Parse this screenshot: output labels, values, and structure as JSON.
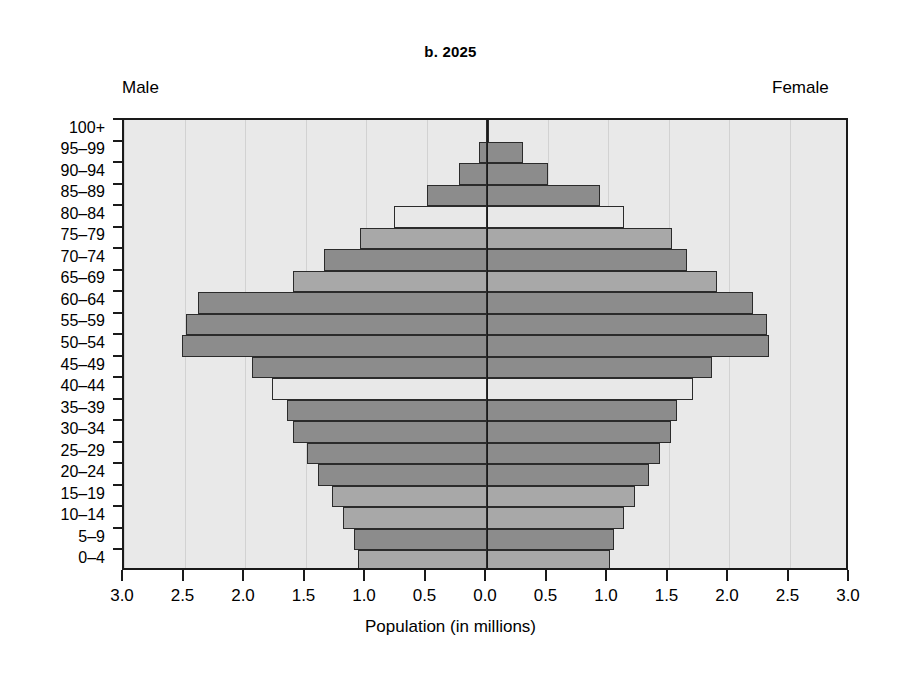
{
  "title": "b. 2025",
  "labels": {
    "male": "Male",
    "female": "Female",
    "axis_title": "Population (in millions)"
  },
  "colors": {
    "plot_background": "#e9e9e9",
    "axis": "#1a1a1a",
    "bar_dark": "#8c8c8c",
    "bar_mid": "#a8a8a8",
    "bar_light": "#e8e8e8",
    "gridline": "#d2d2d2",
    "page_background": "#ffffff"
  },
  "chart_data": {
    "type": "bar",
    "subtype": "population-pyramid",
    "title": "b. 2025",
    "xlabel": "Population (in millions)",
    "ylabel": "",
    "grid": true,
    "legend_position": "none",
    "xlim": [
      -3.0,
      3.0
    ],
    "xticks": [
      3.0,
      2.5,
      2.0,
      1.5,
      1.0,
      0.5,
      0.0,
      0.5,
      1.0,
      1.5,
      2.0,
      2.5,
      3.0
    ],
    "xtick_labels": [
      "3.0",
      "2.5",
      "2.0",
      "1.5",
      "1.0",
      "0.5",
      "0.0",
      "0.5",
      "1.0",
      "1.5",
      "2.0",
      "2.5",
      "3.0"
    ],
    "categories": [
      "0–4",
      "5–9",
      "10–14",
      "15–19",
      "20–24",
      "25–29",
      "30–34",
      "35–39",
      "40–44",
      "45–49",
      "50–54",
      "55–59",
      "60–64",
      "65–69",
      "70–74",
      "75–79",
      "80–84",
      "85–89",
      "90–94",
      "95–99",
      "100+"
    ],
    "series": [
      {
        "name": "Male",
        "side": "left",
        "values": [
          1.07,
          1.1,
          1.19,
          1.28,
          1.4,
          1.49,
          1.6,
          1.65,
          1.78,
          1.94,
          2.52,
          2.49,
          2.39,
          1.6,
          1.35,
          1.05,
          0.77,
          0.5,
          0.23,
          0.07,
          0.01
        ]
      },
      {
        "name": "Female",
        "side": "right",
        "values": [
          1.02,
          1.05,
          1.13,
          1.22,
          1.34,
          1.43,
          1.52,
          1.57,
          1.7,
          1.86,
          2.33,
          2.31,
          2.2,
          1.9,
          1.65,
          1.53,
          1.13,
          0.93,
          0.5,
          0.3,
          0.02
        ]
      }
    ],
    "bar_shades": [
      "mid",
      "dark",
      "mid",
      "mid",
      "dark",
      "dark",
      "dark",
      "dark",
      "light",
      "dark",
      "dark",
      "dark",
      "dark",
      "mid",
      "dark",
      "mid",
      "light",
      "dark",
      "dark",
      "dark",
      "dark"
    ]
  }
}
